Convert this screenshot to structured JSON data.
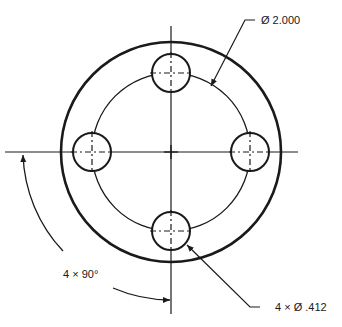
{
  "drawing": {
    "title": "Bolt circle flange drawing",
    "colors": {
      "line": "#1a1a1a",
      "background": "#ffffff"
    },
    "center": {
      "x": 171,
      "y": 152
    },
    "outer_circle_radius_px": 110,
    "bolt_circle_radius_px": 79,
    "hole_radius_px": 19,
    "hole_count": 4
  },
  "annotations": {
    "bolt_circle_diameter": "Ø 2.000",
    "hole_callout": "4 × Ø .412",
    "angular_spacing": "4 × 90°"
  }
}
